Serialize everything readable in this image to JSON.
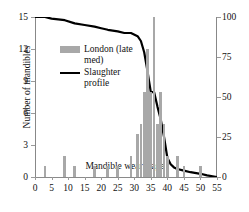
{
  "chart_data": {
    "type": "bar",
    "title": "",
    "xlabel": "Mandible wear stage",
    "ylabel": "Number of mandibles",
    "y2label": "Percentage survival",
    "xlim": [
      0,
      55
    ],
    "ylim": [
      0,
      15
    ],
    "y2lim": [
      0,
      100
    ],
    "grid": false,
    "legend_position": "upper-left-inside",
    "xticks": [
      "0",
      "5",
      "10",
      "15",
      "20",
      "25",
      "30",
      "35",
      "40",
      "45",
      "50",
      "55"
    ],
    "yticks": [
      "0",
      "3",
      "6",
      "9",
      "12",
      "15"
    ],
    "y2ticks": [
      "0",
      "25",
      "50",
      "75",
      "100"
    ],
    "series": [
      {
        "name": "London (late med)",
        "type": "bar",
        "axis": "left",
        "color": "#a8a8a8",
        "x": [
          3,
          9,
          12,
          18,
          22,
          25,
          29,
          31,
          32,
          33,
          34,
          35,
          36,
          37,
          38,
          39,
          40,
          43,
          45,
          50
        ],
        "values": [
          1,
          2,
          1,
          1,
          1,
          1,
          2,
          4,
          5,
          8,
          12,
          8,
          15,
          5,
          8,
          5,
          2,
          2,
          1,
          1
        ]
      },
      {
        "name": "Slaughter profile",
        "type": "line",
        "axis": "right",
        "color": "#000000",
        "x": [
          0,
          3,
          5,
          9,
          12,
          15,
          18,
          20,
          22,
          25,
          27,
          29,
          31,
          32,
          33,
          34,
          35,
          36,
          37,
          38,
          39,
          40,
          41,
          42,
          43,
          45,
          47,
          50,
          52,
          55
        ],
        "values": [
          100,
          100,
          99,
          98,
          96,
          95,
          94,
          93,
          92,
          91,
          90,
          90,
          88,
          85,
          78,
          66,
          53,
          53,
          44,
          36,
          25,
          12,
          8,
          6,
          5,
          4,
          3,
          2,
          1,
          0
        ]
      }
    ],
    "legend": [
      {
        "label": "London (late med)",
        "marker": "bar",
        "color": "#a8a8a8"
      },
      {
        "label": "Slaughter profile",
        "marker": "line",
        "color": "#000000"
      }
    ]
  },
  "colors": {
    "bar": "#a8a8a8",
    "line": "#000000",
    "axis": "#8a8a8a",
    "text": "#111111",
    "background": "#ffffff"
  }
}
